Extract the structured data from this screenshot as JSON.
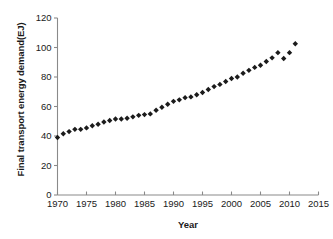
{
  "chart_data": {
    "type": "scatter",
    "title": "",
    "xlabel": "Year",
    "ylabel": "Final transport energy demand(EJ)",
    "xlim": [
      1970,
      2015
    ],
    "ylim": [
      0,
      120
    ],
    "xticks": [
      1970,
      1975,
      1980,
      1985,
      1990,
      1995,
      2000,
      2005,
      2010,
      2015
    ],
    "xtick_labels": [
      "1970",
      "1975",
      "1980",
      "1985",
      "1990",
      "1995",
      "2000",
      "2005",
      "2010",
      "2015"
    ],
    "yticks": [
      0,
      20,
      40,
      60,
      80,
      100,
      120
    ],
    "ytick_labels": [
      "0",
      "20",
      "40",
      "60",
      "80",
      "100",
      "120"
    ],
    "grid": false,
    "legend": null,
    "marker": "diamond",
    "marker_color": "#1b1b1b",
    "x": [
      1970,
      1971,
      1972,
      1973,
      1974,
      1975,
      1976,
      1977,
      1978,
      1979,
      1980,
      1981,
      1982,
      1983,
      1984,
      1985,
      1986,
      1987,
      1988,
      1989,
      1990,
      1991,
      1992,
      1993,
      1994,
      1995,
      1996,
      1997,
      1998,
      1999,
      2000,
      2001,
      2002,
      2003,
      2004,
      2005,
      2006,
      2007,
      2008,
      2009,
      2010
    ],
    "values": [
      39.0,
      41.5,
      43.0,
      44.5,
      44.5,
      45.5,
      47.0,
      48.0,
      49.5,
      50.5,
      51.5,
      51.5,
      52.0,
      53.0,
      54.0,
      54.5,
      55.0,
      57.5,
      59.5,
      61.5,
      63.5,
      64.5,
      66.0,
      66.5,
      68.0,
      69.5,
      71.5,
      73.5,
      75.0,
      77.0,
      79.0,
      80.0,
      82.5,
      84.5,
      86.5,
      88.0,
      90.5,
      93.0,
      96.5,
      92.5,
      96.5
    ],
    "extra_points": [
      {
        "x": 2011,
        "y": 102.5
      }
    ]
  }
}
